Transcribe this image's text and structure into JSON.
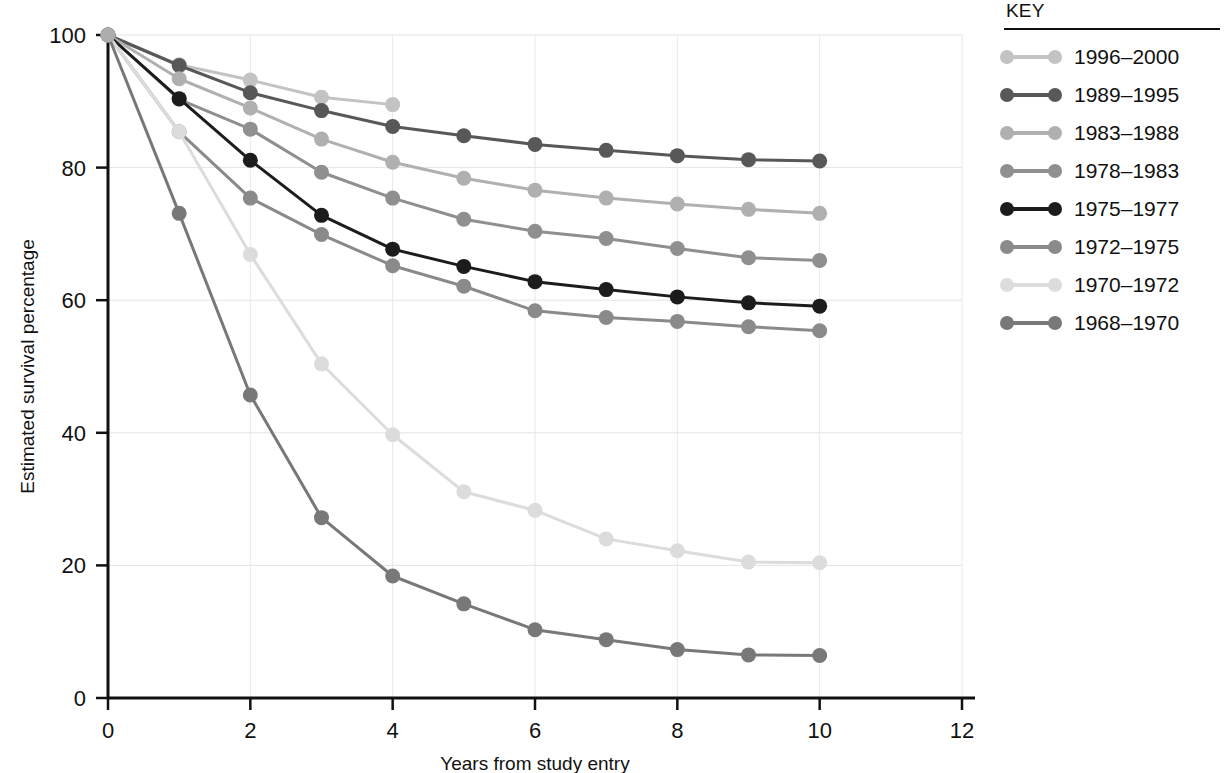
{
  "legend": {
    "title": "KEY",
    "position": "right",
    "entries": [
      {
        "label": "1996–2000",
        "color": "#c3c3c3"
      },
      {
        "label": "1989–1995",
        "color": "#585858"
      },
      {
        "label": "1983–1988",
        "color": "#b0b0b0"
      },
      {
        "label": "1978–1983",
        "color": "#8f8f8f"
      },
      {
        "label": "1975–1977",
        "color": "#1c1c1c"
      },
      {
        "label": "1972–1975",
        "color": "#8a8a8a"
      },
      {
        "label": "1970–1972",
        "color": "#dcdcdc"
      },
      {
        "label": "1968–1970",
        "color": "#787878"
      }
    ]
  },
  "chart_data": {
    "type": "line",
    "title": "",
    "subtitle": "",
    "xlabel": "Years from study entry",
    "ylabel": "Estimated survival percentage",
    "xlim": [
      0,
      12
    ],
    "ylim": [
      0,
      100
    ],
    "xticks": [
      0,
      2,
      4,
      6,
      8,
      10,
      12
    ],
    "yticks": [
      0,
      20,
      40,
      60,
      80,
      100
    ],
    "grid": true,
    "x": [
      0,
      1,
      2,
      3,
      4,
      5,
      6,
      7,
      8,
      9,
      10
    ],
    "series": [
      {
        "name": "1996–2000",
        "color": "#c3c3c3",
        "x": [
          0,
          1,
          2,
          3,
          4
        ],
        "values": [
          100,
          95.5,
          93.2,
          90.6,
          89.5
        ]
      },
      {
        "name": "1989–1995",
        "color": "#585858",
        "x": [
          0,
          1,
          2,
          3,
          4,
          5,
          6,
          7,
          8,
          9,
          10
        ],
        "values": [
          100,
          95.4,
          91.3,
          88.6,
          86.2,
          84.8,
          83.5,
          82.6,
          81.8,
          81.2,
          81.0
        ]
      },
      {
        "name": "1983–1988",
        "color": "#b0b0b0",
        "x": [
          0,
          1,
          2,
          3,
          4,
          5,
          6,
          7,
          8,
          9,
          10
        ],
        "values": [
          100,
          93.4,
          89.0,
          84.3,
          80.8,
          78.4,
          76.6,
          75.4,
          74.5,
          73.7,
          73.1
        ]
      },
      {
        "name": "1978–1983",
        "color": "#8f8f8f",
        "x": [
          0,
          1,
          2,
          3,
          4,
          5,
          6,
          7,
          8,
          9,
          10
        ],
        "values": [
          100,
          90.3,
          85.8,
          79.3,
          75.4,
          72.2,
          70.4,
          69.3,
          67.8,
          66.4,
          66.0
        ]
      },
      {
        "name": "1975–1977",
        "color": "#1c1c1c",
        "x": [
          0,
          1,
          2,
          3,
          4,
          5,
          6,
          7,
          8,
          9,
          10
        ],
        "values": [
          100,
          90.4,
          81.1,
          72.8,
          67.7,
          65.1,
          62.8,
          61.6,
          60.5,
          59.6,
          59.1
        ]
      },
      {
        "name": "1972–1975",
        "color": "#8a8a8a",
        "x": [
          0,
          1,
          2,
          3,
          4,
          5,
          6,
          7,
          8,
          9,
          10
        ],
        "values": [
          100,
          85.4,
          75.4,
          69.9,
          65.2,
          62.1,
          58.4,
          57.4,
          56.8,
          56.0,
          55.4
        ]
      },
      {
        "name": "1970–1972",
        "color": "#dcdcdc",
        "x": [
          0,
          1,
          2,
          3,
          4,
          5,
          6,
          7,
          8,
          9,
          10
        ],
        "values": [
          100,
          85.4,
          66.9,
          50.4,
          39.7,
          31.1,
          28.3,
          24.0,
          22.2,
          20.5,
          20.4
        ]
      },
      {
        "name": "1968–1970",
        "color": "#787878",
        "x": [
          0,
          1,
          2,
          3,
          4,
          5,
          6,
          7,
          8,
          9,
          10
        ],
        "values": [
          100,
          73.1,
          45.7,
          27.2,
          18.4,
          14.2,
          10.3,
          8.8,
          7.3,
          6.5,
          6.4
        ]
      }
    ]
  }
}
